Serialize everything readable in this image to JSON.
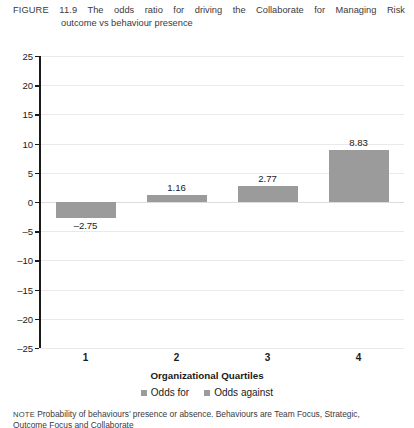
{
  "figure": {
    "label": "FIGURE 11.9",
    "caption_line1": "The odds ratio for driving the Collaborate for Managing Risk",
    "caption_line2": "outcome vs behaviour presence"
  },
  "note": {
    "label": "NOTE",
    "line1": "Probability of behaviours’ presence or absence. Behaviours are Team Focus, Strategic,",
    "line2": "Outcome Focus and Collaborate"
  },
  "colors": {
    "bar": "#9b9b9b",
    "axis": "#1a1a1a",
    "grid": "#e9e9ea",
    "text": "#1a1a1a"
  },
  "chart_data": {
    "type": "bar",
    "title": "",
    "xlabel": "Organizational Quartiles",
    "ylabel": "",
    "categories": [
      "1",
      "2",
      "3",
      "4"
    ],
    "values": [
      -2.75,
      1.16,
      2.77,
      8.83
    ],
    "data_labels": [
      "–2.75",
      "1.16",
      "2.77",
      "8.83"
    ],
    "ylim": [
      -25,
      25
    ],
    "ytick_step": 5,
    "yticks": [
      25,
      20,
      15,
      10,
      5,
      0,
      -5,
      -10,
      -15,
      -20,
      -25
    ],
    "ytick_labels": [
      "25",
      "20",
      "15",
      "10",
      "5",
      "0",
      "–5",
      "–10",
      "–15",
      "–20",
      "–25"
    ],
    "grid": true,
    "legend_position": "bottom",
    "legend": [
      "Odds for",
      "Odds against"
    ],
    "series": [
      {
        "name": "Odds for",
        "values": [
          -2.75,
          1.16,
          2.77,
          8.83
        ]
      }
    ]
  }
}
